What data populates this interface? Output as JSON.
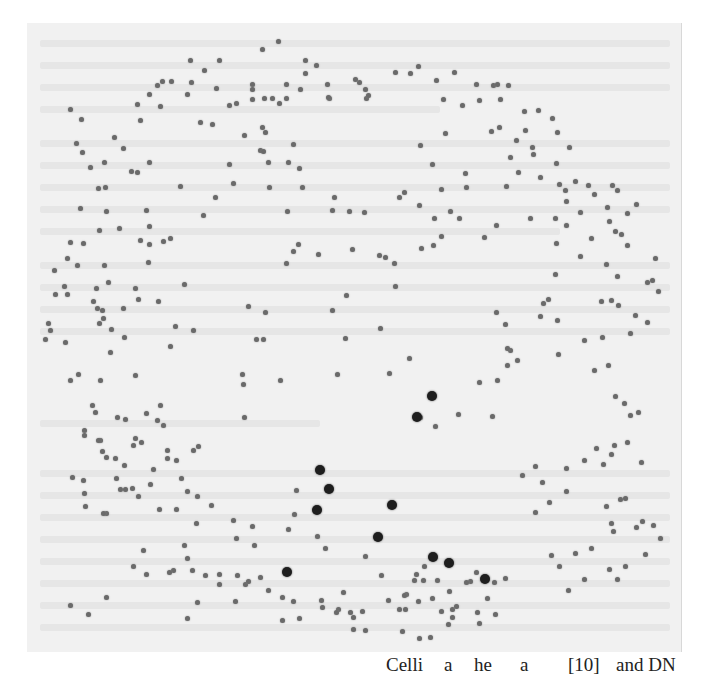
{
  "page": {
    "background_text": "illegible faint show-through text",
    "ghost_lines": [
      {
        "x": 40,
        "y": 40,
        "w": 630
      },
      {
        "x": 40,
        "y": 62,
        "w": 630
      },
      {
        "x": 40,
        "y": 84,
        "w": 630
      },
      {
        "x": 40,
        "y": 106,
        "w": 400
      },
      {
        "x": 40,
        "y": 140,
        "w": 630
      },
      {
        "x": 40,
        "y": 162,
        "w": 630
      },
      {
        "x": 40,
        "y": 184,
        "w": 630
      },
      {
        "x": 40,
        "y": 206,
        "w": 630
      },
      {
        "x": 40,
        "y": 228,
        "w": 520
      },
      {
        "x": 40,
        "y": 262,
        "w": 630
      },
      {
        "x": 40,
        "y": 284,
        "w": 630
      },
      {
        "x": 40,
        "y": 306,
        "w": 630
      },
      {
        "x": 40,
        "y": 328,
        "w": 630
      },
      {
        "x": 40,
        "y": 420,
        "w": 280
      },
      {
        "x": 40,
        "y": 470,
        "w": 630
      },
      {
        "x": 40,
        "y": 492,
        "w": 630
      },
      {
        "x": 40,
        "y": 514,
        "w": 630
      },
      {
        "x": 40,
        "y": 536,
        "w": 630
      },
      {
        "x": 40,
        "y": 558,
        "w": 630
      },
      {
        "x": 40,
        "y": 580,
        "w": 630
      },
      {
        "x": 40,
        "y": 602,
        "w": 630
      },
      {
        "x": 40,
        "y": 624,
        "w": 630
      }
    ]
  },
  "overlay": {
    "small_dot_color": "#6a6a6a",
    "big_dot_color": "#1e1e1e",
    "big_dots": [
      [
        432,
        396
      ],
      [
        417,
        417
      ],
      [
        320,
        470
      ],
      [
        329,
        489
      ],
      [
        317,
        510
      ],
      [
        392,
        505
      ],
      [
        378,
        537
      ],
      [
        287,
        572
      ],
      [
        433,
        557
      ],
      [
        449,
        563
      ],
      [
        485,
        579
      ]
    ],
    "small_dots": [
      [
        278,
        41
      ],
      [
        262,
        49
      ],
      [
        305,
        60
      ],
      [
        219,
        60
      ],
      [
        190,
        60
      ],
      [
        162,
        81
      ],
      [
        171,
        81
      ],
      [
        204,
        70
      ],
      [
        191,
        82
      ],
      [
        252,
        84
      ],
      [
        252,
        89
      ],
      [
        216,
        88
      ],
      [
        286,
        84
      ],
      [
        286,
        98
      ],
      [
        327,
        84
      ],
      [
        329,
        98
      ],
      [
        300,
        89
      ],
      [
        328,
        97
      ],
      [
        252,
        99
      ],
      [
        264,
        98
      ],
      [
        272,
        98
      ],
      [
        236,
        103
      ],
      [
        316,
        65
      ],
      [
        305,
        73
      ],
      [
        359,
        82
      ],
      [
        365,
        89
      ],
      [
        366,
        98
      ],
      [
        149,
        94
      ],
      [
        137,
        104
      ],
      [
        160,
        106
      ],
      [
        187,
        94
      ],
      [
        157,
        85
      ],
      [
        355,
        79
      ],
      [
        368,
        95
      ],
      [
        410,
        73
      ],
      [
        395,
        72
      ],
      [
        418,
        66
      ],
      [
        436,
        80
      ],
      [
        443,
        99
      ],
      [
        454,
        72
      ],
      [
        476,
        84
      ],
      [
        479,
        100
      ],
      [
        508,
        85
      ],
      [
        462,
        105
      ],
      [
        493,
        85
      ],
      [
        497,
        84
      ],
      [
        500,
        99
      ],
      [
        524,
        111
      ],
      [
        538,
        110
      ],
      [
        552,
        118
      ],
      [
        499,
        127
      ],
      [
        525,
        130
      ],
      [
        557,
        132
      ],
      [
        516,
        140
      ],
      [
        532,
        147
      ],
      [
        569,
        147
      ],
      [
        533,
        154
      ],
      [
        510,
        157
      ],
      [
        556,
        163
      ],
      [
        518,
        172
      ],
      [
        540,
        177
      ],
      [
        575,
        181
      ],
      [
        506,
        186
      ],
      [
        559,
        184
      ],
      [
        565,
        190
      ],
      [
        588,
        185
      ],
      [
        612,
        185
      ],
      [
        594,
        194
      ],
      [
        617,
        190
      ],
      [
        566,
        201
      ],
      [
        580,
        212
      ],
      [
        607,
        207
      ],
      [
        636,
        204
      ],
      [
        627,
        213
      ],
      [
        609,
        221
      ],
      [
        615,
        231
      ],
      [
        555,
        218
      ],
      [
        530,
        218
      ],
      [
        566,
        225
      ],
      [
        496,
        225
      ],
      [
        484,
        237
      ],
      [
        556,
        243
      ],
      [
        591,
        238
      ],
      [
        621,
        234
      ],
      [
        627,
        245
      ],
      [
        229,
        105
      ],
      [
        244,
        135
      ],
      [
        200,
        122
      ],
      [
        212,
        124
      ],
      [
        262,
        127
      ],
      [
        279,
        103
      ],
      [
        265,
        132
      ],
      [
        293,
        144
      ],
      [
        268,
        162
      ],
      [
        260,
        150
      ],
      [
        288,
        162
      ],
      [
        269,
        187
      ],
      [
        299,
        168
      ],
      [
        263,
        151
      ],
      [
        302,
        187
      ],
      [
        334,
        197
      ],
      [
        332,
        210
      ],
      [
        287,
        211
      ],
      [
        349,
        211
      ],
      [
        364,
        212
      ],
      [
        420,
        145
      ],
      [
        432,
        164
      ],
      [
        491,
        131
      ],
      [
        399,
        197
      ],
      [
        441,
        189
      ],
      [
        450,
        211
      ],
      [
        459,
        218
      ],
      [
        434,
        218
      ],
      [
        404,
        192
      ],
      [
        419,
        205
      ],
      [
        445,
        133
      ],
      [
        465,
        173
      ],
      [
        466,
        187
      ],
      [
        421,
        248
      ],
      [
        70,
        109
      ],
      [
        81,
        119
      ],
      [
        76,
        143
      ],
      [
        82,
        152
      ],
      [
        90,
        167
      ],
      [
        104,
        162
      ],
      [
        114,
        137
      ],
      [
        123,
        148
      ],
      [
        140,
        120
      ],
      [
        137,
        172
      ],
      [
        105,
        187
      ],
      [
        131,
        171
      ],
      [
        149,
        162
      ],
      [
        106,
        211
      ],
      [
        119,
        228
      ],
      [
        146,
        210
      ],
      [
        149,
        226
      ],
      [
        80,
        208
      ],
      [
        98,
        188
      ],
      [
        70,
        242
      ],
      [
        83,
        243
      ],
      [
        99,
        230
      ],
      [
        149,
        244
      ],
      [
        163,
        241
      ],
      [
        170,
        238
      ],
      [
        203,
        215
      ],
      [
        215,
        197
      ],
      [
        229,
        164
      ],
      [
        233,
        183
      ],
      [
        180,
        186
      ],
      [
        67,
        258
      ],
      [
        77,
        265
      ],
      [
        64,
        286
      ],
      [
        67,
        294
      ],
      [
        96,
        288
      ],
      [
        104,
        265
      ],
      [
        108,
        282
      ],
      [
        93,
        301
      ],
      [
        97,
        308
      ],
      [
        99,
        323
      ],
      [
        103,
        318
      ],
      [
        102,
        310
      ],
      [
        111,
        329
      ],
      [
        110,
        352
      ],
      [
        123,
        308
      ],
      [
        124,
        337
      ],
      [
        135,
        288
      ],
      [
        140,
        240
      ],
      [
        148,
        262
      ],
      [
        158,
        301
      ],
      [
        138,
        299
      ],
      [
        184,
        284
      ],
      [
        175,
        326
      ],
      [
        193,
        330
      ],
      [
        248,
        306
      ],
      [
        265,
        312
      ],
      [
        263,
        339
      ],
      [
        170,
        346
      ],
      [
        256,
        339
      ],
      [
        243,
        384
      ],
      [
        280,
        380
      ],
      [
        160,
        405
      ],
      [
        135,
        375
      ],
      [
        244,
        417
      ],
      [
        242,
        374
      ],
      [
        48,
        323
      ],
      [
        50,
        330
      ],
      [
        55,
        294
      ],
      [
        54,
        270
      ],
      [
        65,
        342
      ],
      [
        45,
        339
      ],
      [
        70,
        380
      ],
      [
        78,
        374
      ],
      [
        100,
        380
      ],
      [
        92,
        405
      ],
      [
        95,
        412
      ],
      [
        84,
        430
      ],
      [
        84,
        435
      ],
      [
        100,
        440
      ],
      [
        117,
        417
      ],
      [
        125,
        419
      ],
      [
        146,
        413
      ],
      [
        135,
        438
      ],
      [
        157,
        420
      ],
      [
        163,
        425
      ],
      [
        133,
        445
      ],
      [
        167,
        458
      ],
      [
        153,
        469
      ],
      [
        124,
        465
      ],
      [
        116,
        478
      ],
      [
        120,
        489
      ],
      [
        98,
        440
      ],
      [
        106,
        457
      ],
      [
        141,
        442
      ],
      [
        72,
        477
      ],
      [
        83,
        480
      ],
      [
        84,
        493
      ],
      [
        102,
        451
      ],
      [
        115,
        458
      ],
      [
        132,
        488
      ],
      [
        85,
        506
      ],
      [
        106,
        513
      ],
      [
        103,
        513
      ],
      [
        125,
        489
      ],
      [
        138,
        496
      ],
      [
        150,
        484
      ],
      [
        167,
        450
      ],
      [
        193,
        450
      ],
      [
        198,
        446
      ],
      [
        176,
        460
      ],
      [
        181,
        478
      ],
      [
        159,
        509
      ],
      [
        176,
        509
      ],
      [
        196,
        523
      ],
      [
        184,
        545
      ],
      [
        187,
        558
      ],
      [
        173,
        570
      ],
      [
        133,
        566
      ],
      [
        143,
        550
      ],
      [
        146,
        574
      ],
      [
        106,
        597
      ],
      [
        88,
        614
      ],
      [
        70,
        605
      ],
      [
        187,
        491
      ],
      [
        197,
        496
      ],
      [
        211,
        505
      ],
      [
        233,
        520
      ],
      [
        236,
        538
      ],
      [
        252,
        526
      ],
      [
        254,
        545
      ],
      [
        260,
        577
      ],
      [
        282,
        597
      ],
      [
        296,
        490
      ],
      [
        294,
        514
      ],
      [
        288,
        529
      ],
      [
        317,
        536
      ],
      [
        325,
        548
      ],
      [
        365,
        556
      ],
      [
        381,
        575
      ],
      [
        388,
        600
      ],
      [
        406,
        594
      ],
      [
        423,
        580
      ],
      [
        432,
        598
      ],
      [
        441,
        611
      ],
      [
        448,
        624
      ],
      [
        430,
        637
      ],
      [
        419,
        638
      ],
      [
        405,
        609
      ],
      [
        362,
        611
      ],
      [
        353,
        617
      ],
      [
        338,
        609
      ],
      [
        321,
        600
      ],
      [
        322,
        607
      ],
      [
        169,
        572
      ],
      [
        192,
        570
      ],
      [
        205,
        575
      ],
      [
        219,
        574
      ],
      [
        237,
        575
      ],
      [
        245,
        584
      ],
      [
        248,
        581
      ],
      [
        219,
        584
      ],
      [
        235,
        601
      ],
      [
        197,
        602
      ],
      [
        187,
        618
      ],
      [
        268,
        590
      ],
      [
        282,
        620
      ],
      [
        293,
        601
      ],
      [
        299,
        618
      ],
      [
        350,
        612
      ],
      [
        336,
        612
      ],
      [
        343,
        592
      ],
      [
        353,
        629
      ],
      [
        365,
        630
      ],
      [
        399,
        609
      ],
      [
        402,
        631
      ],
      [
        414,
        580
      ],
      [
        418,
        601
      ],
      [
        452,
        617
      ],
      [
        452,
        609
      ],
      [
        470,
        581
      ],
      [
        487,
        598
      ],
      [
        505,
        578
      ],
      [
        495,
        614
      ],
      [
        477,
        612
      ],
      [
        437,
        580
      ],
      [
        424,
        566
      ],
      [
        416,
        574
      ],
      [
        404,
        595
      ],
      [
        298,
        244
      ],
      [
        293,
        251
      ],
      [
        286,
        263
      ],
      [
        318,
        254
      ],
      [
        352,
        249
      ],
      [
        379,
        255
      ],
      [
        385,
        257
      ],
      [
        394,
        263
      ],
      [
        433,
        245
      ],
      [
        441,
        236
      ],
      [
        395,
        286
      ],
      [
        346,
        295
      ],
      [
        332,
        310
      ],
      [
        380,
        328
      ],
      [
        345,
        338
      ],
      [
        337,
        374
      ],
      [
        389,
        373
      ],
      [
        409,
        358
      ],
      [
        420,
        417
      ],
      [
        435,
        426
      ],
      [
        458,
        414
      ],
      [
        479,
        382
      ],
      [
        497,
        380
      ],
      [
        510,
        350
      ],
      [
        543,
        303
      ],
      [
        548,
        299
      ],
      [
        555,
        274
      ],
      [
        580,
        256
      ],
      [
        606,
        264
      ],
      [
        617,
        276
      ],
      [
        601,
        301
      ],
      [
        611,
        300
      ],
      [
        618,
        305
      ],
      [
        630,
        333
      ],
      [
        652,
        280
      ],
      [
        655,
        258
      ],
      [
        647,
        282
      ],
      [
        658,
        291
      ],
      [
        635,
        315
      ],
      [
        647,
        322
      ],
      [
        496,
        312
      ],
      [
        505,
        324
      ],
      [
        507,
        348
      ],
      [
        507,
        365
      ],
      [
        540,
        316
      ],
      [
        557,
        320
      ],
      [
        558,
        354
      ],
      [
        517,
        360
      ],
      [
        584,
        340
      ],
      [
        602,
        337
      ],
      [
        594,
        370
      ],
      [
        608,
        365
      ],
      [
        615,
        396
      ],
      [
        624,
        403
      ],
      [
        630,
        415
      ],
      [
        638,
        412
      ],
      [
        641,
        462
      ],
      [
        627,
        442
      ],
      [
        614,
        445
      ],
      [
        611,
        454
      ],
      [
        603,
        464
      ],
      [
        596,
        448
      ],
      [
        584,
        460
      ],
      [
        566,
        468
      ],
      [
        542,
        482
      ],
      [
        535,
        466
      ],
      [
        492,
        416
      ],
      [
        522,
        475
      ],
      [
        535,
        512
      ],
      [
        549,
        502
      ],
      [
        566,
        491
      ],
      [
        606,
        506
      ],
      [
        611,
        523
      ],
      [
        613,
        531
      ],
      [
        620,
        499
      ],
      [
        625,
        498
      ],
      [
        636,
        527
      ],
      [
        642,
        521
      ],
      [
        653,
        525
      ],
      [
        660,
        538
      ],
      [
        645,
        554
      ],
      [
        551,
        555
      ],
      [
        575,
        553
      ],
      [
        591,
        548
      ],
      [
        609,
        569
      ],
      [
        625,
        566
      ],
      [
        617,
        579
      ],
      [
        584,
        579
      ],
      [
        568,
        590
      ],
      [
        559,
        566
      ],
      [
        494,
        582
      ],
      [
        476,
        572
      ],
      [
        466,
        582
      ],
      [
        449,
        591
      ],
      [
        456,
        606
      ],
      [
        479,
        623
      ]
    ]
  },
  "caption": {
    "fragments": [
      {
        "x": 386,
        "text": "Celli"
      },
      {
        "x": 444,
        "text": "a"
      },
      {
        "x": 474,
        "text": "he"
      },
      {
        "x": 520,
        "text": "a"
      },
      {
        "x": 568,
        "text": "[10]"
      },
      {
        "x": 616,
        "text": "and DN"
      }
    ]
  }
}
